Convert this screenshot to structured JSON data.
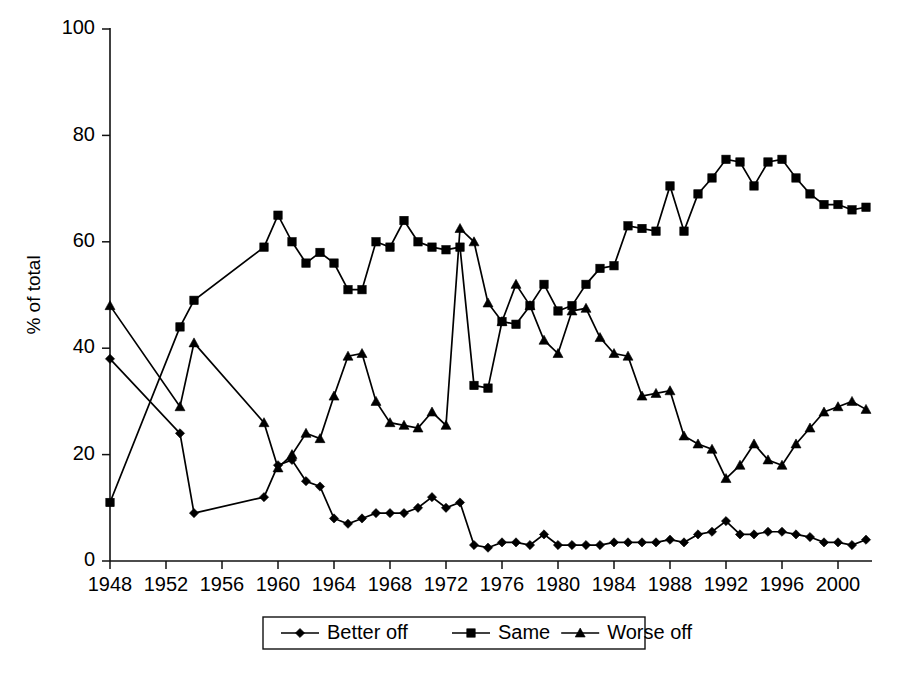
{
  "chart_data": {
    "type": "line",
    "title": "",
    "subtitle": "",
    "xlabel": "",
    "ylabel": "% of total",
    "ylim": [
      0,
      100
    ],
    "xlim": [
      1947,
      2003
    ],
    "yticks": [
      0,
      20,
      40,
      60,
      80,
      100
    ],
    "xticks": [
      1948,
      1952,
      1956,
      1960,
      1964,
      1968,
      1972,
      1976,
      1980,
      1984,
      1988,
      1992,
      1996,
      2000
    ],
    "grid": false,
    "legend_position": "bottom-center",
    "markers": {
      "Better off": "diamond",
      "Same": "square",
      "Worse off": "triangle"
    },
    "colors": {
      "Better off": "#000000",
      "Same": "#000000",
      "Worse off": "#000000"
    },
    "series": [
      {
        "name": "Better off",
        "marker": "diamond",
        "points": [
          [
            1948,
            38
          ],
          [
            1953,
            24
          ],
          [
            1954,
            9
          ],
          [
            1959,
            12
          ],
          [
            1960,
            18
          ],
          [
            1961,
            19
          ],
          [
            1962,
            15
          ],
          [
            1963,
            14
          ],
          [
            1964,
            8
          ],
          [
            1965,
            7
          ],
          [
            1966,
            8
          ],
          [
            1967,
            9
          ],
          [
            1968,
            9
          ],
          [
            1969,
            9
          ],
          [
            1970,
            10
          ],
          [
            1971,
            12
          ],
          [
            1972,
            10
          ],
          [
            1973,
            11
          ],
          [
            1974,
            3
          ],
          [
            1975,
            2.5
          ],
          [
            1976,
            3.5
          ],
          [
            1977,
            3.5
          ],
          [
            1978,
            3
          ],
          [
            1979,
            5
          ],
          [
            1980,
            3
          ],
          [
            1981,
            3
          ],
          [
            1982,
            3
          ],
          [
            1983,
            3
          ],
          [
            1984,
            3.5
          ],
          [
            1985,
            3.5
          ],
          [
            1986,
            3.5
          ],
          [
            1987,
            3.5
          ],
          [
            1988,
            4
          ],
          [
            1989,
            3.5
          ],
          [
            1990,
            5
          ],
          [
            1991,
            5.5
          ],
          [
            1992,
            7.5
          ],
          [
            1993,
            5
          ],
          [
            1994,
            5
          ],
          [
            1995,
            5.5
          ],
          [
            1996,
            5.5
          ],
          [
            1997,
            5
          ],
          [
            1998,
            4.5
          ],
          [
            1999,
            3.5
          ],
          [
            2000,
            3.5
          ],
          [
            2001,
            3
          ],
          [
            2002,
            4
          ]
        ]
      },
      {
        "name": "Same",
        "marker": "square",
        "points": [
          [
            1948,
            11
          ],
          [
            1953,
            44
          ],
          [
            1954,
            49
          ],
          [
            1959,
            59
          ],
          [
            1960,
            65
          ],
          [
            1961,
            60
          ],
          [
            1962,
            56
          ],
          [
            1963,
            58
          ],
          [
            1964,
            56
          ],
          [
            1965,
            51
          ],
          [
            1966,
            51
          ],
          [
            1967,
            60
          ],
          [
            1968,
            59
          ],
          [
            1969,
            64
          ],
          [
            1970,
            60
          ],
          [
            1971,
            59
          ],
          [
            1972,
            58.5
          ],
          [
            1973,
            59
          ],
          [
            1974,
            33
          ],
          [
            1975,
            32.5
          ],
          [
            1976,
            45
          ],
          [
            1977,
            44.5
          ],
          [
            1978,
            48
          ],
          [
            1979,
            52
          ],
          [
            1980,
            47
          ],
          [
            1981,
            48
          ],
          [
            1982,
            52
          ],
          [
            1983,
            55
          ],
          [
            1984,
            55.5
          ],
          [
            1985,
            63
          ],
          [
            1986,
            62.5
          ],
          [
            1987,
            62
          ],
          [
            1988,
            70.5
          ],
          [
            1989,
            62
          ],
          [
            1990,
            69
          ],
          [
            1991,
            72
          ],
          [
            1992,
            75.5
          ],
          [
            1993,
            75
          ],
          [
            1994,
            70.5
          ],
          [
            1995,
            75
          ],
          [
            1996,
            75.5
          ],
          [
            1997,
            72
          ],
          [
            1998,
            69
          ],
          [
            1999,
            67
          ],
          [
            2000,
            67
          ],
          [
            2001,
            66
          ],
          [
            2002,
            66.5
          ]
        ]
      },
      {
        "name": "Worse off",
        "marker": "triangle",
        "points": [
          [
            1948,
            48
          ],
          [
            1953,
            29
          ],
          [
            1954,
            41
          ],
          [
            1959,
            26
          ],
          [
            1960,
            17.5
          ],
          [
            1961,
            20
          ],
          [
            1962,
            24
          ],
          [
            1963,
            23
          ],
          [
            1964,
            31
          ],
          [
            1965,
            38.5
          ],
          [
            1966,
            39
          ],
          [
            1967,
            30
          ],
          [
            1968,
            26
          ],
          [
            1969,
            25.5
          ],
          [
            1970,
            25
          ],
          [
            1971,
            28
          ],
          [
            1972,
            25.5
          ],
          [
            1973,
            62.5
          ],
          [
            1974,
            60
          ],
          [
            1975,
            48.5
          ],
          [
            1976,
            45
          ],
          [
            1977,
            52
          ],
          [
            1978,
            48
          ],
          [
            1979,
            41.5
          ],
          [
            1980,
            39
          ],
          [
            1981,
            47
          ],
          [
            1982,
            47.5
          ],
          [
            1983,
            42
          ],
          [
            1984,
            39
          ],
          [
            1985,
            38.5
          ],
          [
            1986,
            31
          ],
          [
            1987,
            31.5
          ],
          [
            1988,
            32
          ],
          [
            1989,
            23.5
          ],
          [
            1990,
            22
          ],
          [
            1991,
            21
          ],
          [
            1992,
            15.5
          ],
          [
            1993,
            18
          ],
          [
            1994,
            22
          ],
          [
            1995,
            19
          ],
          [
            1996,
            18
          ],
          [
            1997,
            22
          ],
          [
            1998,
            25
          ],
          [
            1999,
            28
          ],
          [
            2000,
            29
          ],
          [
            2001,
            30
          ],
          [
            2002,
            28.5
          ]
        ]
      }
    ],
    "legend": [
      {
        "label": "Better off",
        "marker": "diamond"
      },
      {
        "label": "Same",
        "marker": "square"
      },
      {
        "label": "Worse off",
        "marker": "triangle"
      }
    ]
  }
}
